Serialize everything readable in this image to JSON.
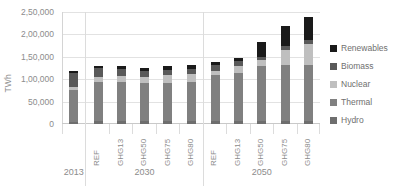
{
  "chart_data": {
    "type": "bar",
    "stacked": true,
    "title": "",
    "xlabel": "",
    "ylabel": "TWh",
    "ylim": [
      0,
      250000
    ],
    "ytick_labels": [
      "0",
      "50,000",
      "1,00,000",
      "1,50,000",
      "2,00,000",
      "2,50,000"
    ],
    "ytick_values": [
      0,
      50000,
      100000,
      150000,
      200000,
      250000
    ],
    "grid": true,
    "legend_position": "right",
    "legend": [
      "Renewables",
      "Biomass",
      "Nuclear",
      "Thermal",
      "Hydro"
    ],
    "series_order_bottom_to_top": [
      "Hydro",
      "Thermal",
      "Nuclear",
      "Biomass",
      "Renewables"
    ],
    "colors": {
      "Renewables": "#1a1a1a",
      "Biomass": "#595959",
      "Nuclear": "#bfbfbf",
      "Thermal": "#808080",
      "Hydro": "#6e6e6e"
    },
    "groups": [
      {
        "year": "2013",
        "scenarios": [
          {
            "label": "",
            "values": {
              "Hydro": 5000,
              "Thermal": 70000,
              "Nuclear": 8000,
              "Biomass": 30000,
              "Renewables": 5000
            },
            "total": 118000
          }
        ]
      },
      {
        "year": "2030",
        "scenarios": [
          {
            "label": "REF",
            "values": {
              "Hydro": 6000,
              "Thermal": 88000,
              "Nuclear": 10000,
              "Biomass": 20000,
              "Renewables": 6000
            },
            "total": 130000
          },
          {
            "label": "GHG13",
            "values": {
              "Hydro": 6000,
              "Thermal": 88000,
              "Nuclear": 14000,
              "Biomass": 14000,
              "Renewables": 7000
            },
            "total": 129000
          },
          {
            "label": "GHG50",
            "values": {
              "Hydro": 6000,
              "Thermal": 85000,
              "Nuclear": 15000,
              "Biomass": 12000,
              "Renewables": 7000
            },
            "total": 125000
          },
          {
            "label": "GHG75",
            "values": {
              "Hydro": 6000,
              "Thermal": 86000,
              "Nuclear": 17000,
              "Biomass": 12000,
              "Renewables": 8000
            },
            "total": 129000
          },
          {
            "label": "GHG80",
            "values": {
              "Hydro": 6000,
              "Thermal": 87000,
              "Nuclear": 18000,
              "Biomass": 12000,
              "Renewables": 9000
            },
            "total": 132000
          }
        ]
      },
      {
        "year": "2050",
        "scenarios": [
          {
            "label": "REF",
            "values": {
              "Hydro": 7000,
              "Thermal": 103000,
              "Nuclear": 8000,
              "Biomass": 14000,
              "Renewables": 6000
            },
            "total": 138000
          },
          {
            "label": "GHG13",
            "values": {
              "Hydro": 7000,
              "Thermal": 108000,
              "Nuclear": 15000,
              "Biomass": 10000,
              "Renewables": 8000
            },
            "total": 148000
          },
          {
            "label": "GHG50",
            "values": {
              "Hydro": 7000,
              "Thermal": 123000,
              "Nuclear": 12000,
              "Biomass": 8000,
              "Renewables": 33000
            },
            "total": 183000
          },
          {
            "label": "GHG75",
            "values": {
              "Hydro": 7000,
              "Thermal": 124000,
              "Nuclear": 35000,
              "Biomass": 9000,
              "Renewables": 43000
            },
            "total": 218000
          },
          {
            "label": "GHG80",
            "values": {
              "Hydro": 7000,
              "Thermal": 124000,
              "Nuclear": 48000,
              "Biomass": 9000,
              "Renewables": 52000
            },
            "total": 240000
          }
        ]
      }
    ]
  }
}
